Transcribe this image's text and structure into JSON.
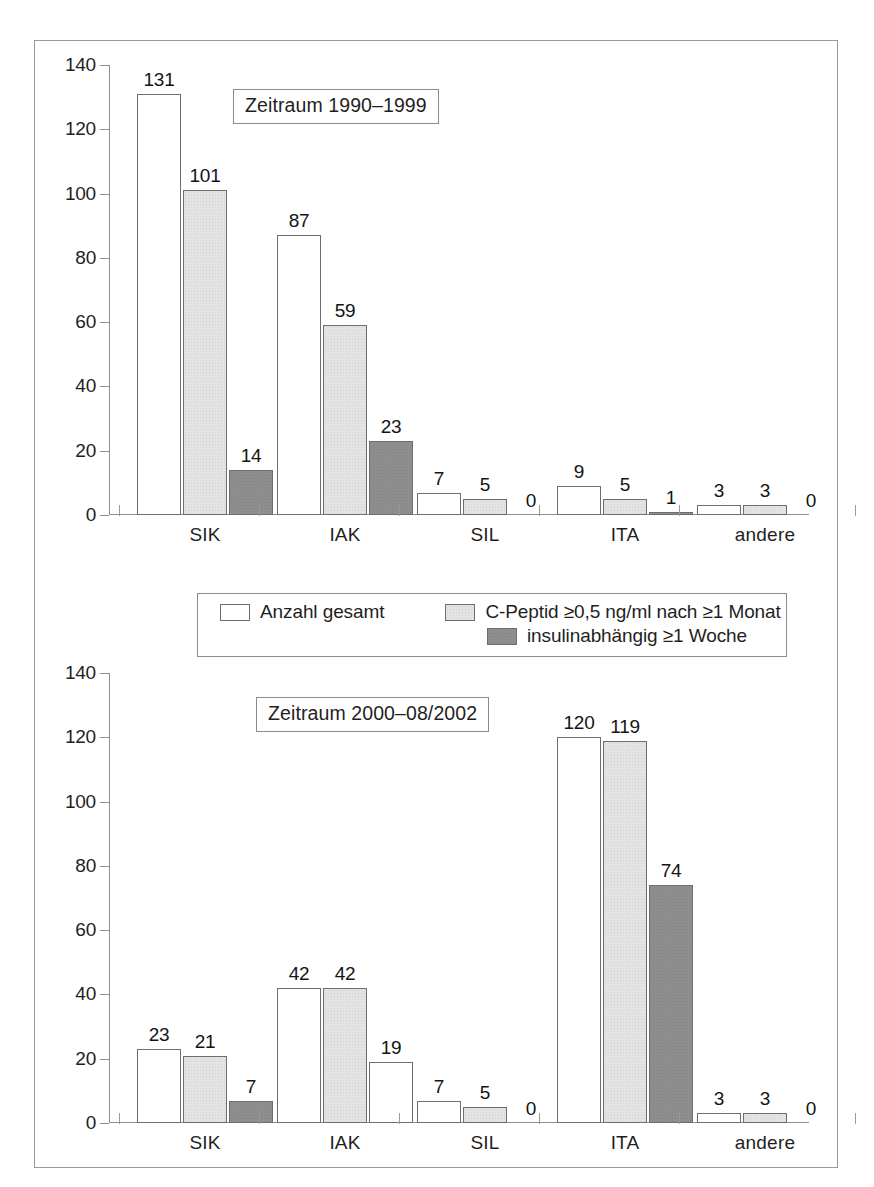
{
  "figure": {
    "legend": {
      "items": [
        {
          "label": "Anzahl gesamt",
          "swatch": "white-square-icon",
          "series_key": "total"
        },
        {
          "label": "C-Peptid ≥0,5 ng/ml nach ≥1 Monat",
          "swatch": "light-gray-square-icon",
          "series_key": "cpeptide"
        },
        {
          "label": "insulinabhängig ≥1 Woche",
          "swatch": "dark-gray-square-icon",
          "series_key": "insulin"
        }
      ]
    },
    "colors": {
      "series_total": "#ffffff",
      "series_cpeptide": "#e3e3e3",
      "series_insulin": "#8e8e8e",
      "outline": "#6e6e6e",
      "axis": "#8f8f8f",
      "frame": "#9a9a9a",
      "text": "#1f1f1f"
    }
  },
  "chart_data": [
    {
      "id": "chart-top",
      "type": "bar",
      "title": "Zeitraum 1990–1999",
      "xlabel": "",
      "ylabel": "",
      "ylim": [
        0,
        140
      ],
      "yticks": [
        0,
        20,
        40,
        60,
        80,
        100,
        120,
        140
      ],
      "ytick_labels": [
        "0",
        "20",
        "40",
        "60",
        "80",
        "100",
        "120",
        "140"
      ],
      "grid": false,
      "legend_position": "below-chart",
      "categories": [
        "SIK",
        "IAK",
        "SIL",
        "ITA",
        "andere"
      ],
      "series": [
        {
          "name": "Anzahl gesamt",
          "fill": "white",
          "values": [
            131,
            87,
            7,
            9,
            3
          ]
        },
        {
          "name": "C-Peptid ≥0,5 ng/ml nach ≥1 Monat",
          "fill": "light-gray",
          "values": [
            101,
            59,
            5,
            5,
            3
          ]
        },
        {
          "name": "insulinabhängig ≥1 Woche",
          "fill": "dark-gray",
          "values": [
            14,
            23,
            0,
            1,
            0
          ]
        }
      ],
      "bar_labels": [
        [
          "131",
          "101",
          "14"
        ],
        [
          "87",
          "59",
          "23"
        ],
        [
          "7",
          "5",
          "0"
        ],
        [
          "9",
          "5",
          "1"
        ],
        [
          "3",
          "3",
          "0"
        ]
      ]
    },
    {
      "id": "chart-bottom",
      "type": "bar",
      "title": "Zeitraum 2000–08/2002",
      "xlabel": "",
      "ylabel": "",
      "ylim": [
        0,
        140
      ],
      "yticks": [
        0,
        20,
        40,
        60,
        80,
        100,
        120,
        140
      ],
      "ytick_labels": [
        "0",
        "20",
        "40",
        "60",
        "80",
        "100",
        "120",
        "140"
      ],
      "grid": false,
      "legend_position": "above-chart",
      "categories": [
        "SIK",
        "IAK",
        "SIL",
        "ITA",
        "andere"
      ],
      "series": [
        {
          "name": "Anzahl gesamt",
          "fill": "white",
          "values": [
            23,
            42,
            7,
            120,
            3
          ]
        },
        {
          "name": "C-Peptid ≥0,5 ng/ml nach ≥1 Monat",
          "fill": "light-gray",
          "values": [
            21,
            42,
            5,
            119,
            3
          ]
        },
        {
          "name": "insulinabhängig ≥1 Woche",
          "fill": "dark-gray",
          "values": [
            7,
            19,
            0,
            74,
            0
          ]
        }
      ],
      "bar_labels": [
        [
          "23",
          "21",
          "7"
        ],
        [
          "42",
          "42",
          "19"
        ],
        [
          "7",
          "5",
          "0"
        ],
        [
          "120",
          "119",
          "74"
        ],
        [
          "3",
          "3",
          "0"
        ]
      ]
    }
  ]
}
